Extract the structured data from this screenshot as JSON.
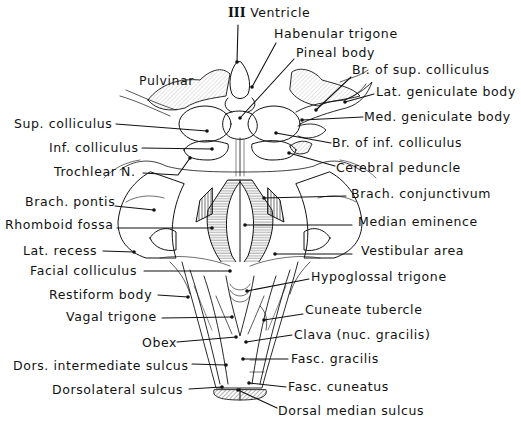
{
  "figure": {
    "ink_color": "#111111",
    "background_color": "#ffffff"
  },
  "labels": {
    "third_ventricle": {
      "roman": "III",
      "text": "Ventricle",
      "x": 228,
      "y": 6,
      "ptr": [
        [
          238,
          25
        ],
        [
          237,
          62
        ]
      ]
    },
    "habenular_trigone": {
      "text": "Habenular trigone",
      "x": 274,
      "y": 27,
      "ptr": [
        [
          276,
          43
        ],
        [
          252,
          87
        ]
      ]
    },
    "pineal_body": {
      "text": "Pineal body",
      "x": 296,
      "y": 46,
      "ptr": [
        [
          294,
          59
        ],
        [
          240,
          118
        ]
      ]
    },
    "pulvinar": {
      "text": "Pulvinar",
      "x": 139,
      "y": 74,
      "ptr": null
    },
    "br_sup_colliculus": {
      "text": "Br. of sup. colliculus",
      "x": 352,
      "y": 63,
      "ptr": [
        [
          351,
          77
        ],
        [
          316,
          110
        ]
      ]
    },
    "lat_geniculate_body": {
      "text": "Lat. geniculate body",
      "x": 376,
      "y": 85,
      "ptr": [
        [
          374,
          94
        ],
        [
          345,
          102
        ]
      ]
    },
    "med_geniculate_body": {
      "text": "Med. geniculate body",
      "x": 364,
      "y": 110,
      "ptr": [
        [
          363,
          117
        ],
        [
          302,
          120
        ]
      ]
    },
    "sup_colliculus": {
      "text": "Sup. colliculus",
      "x": 14,
      "y": 117,
      "ptr": [
        [
          116,
          124
        ],
        [
          207,
          131
        ]
      ]
    },
    "br_inf_colliculus": {
      "text": "Br. of inf. colliculus",
      "x": 332,
      "y": 136,
      "ptr": [
        [
          331,
          143
        ],
        [
          276,
          133
        ]
      ]
    },
    "inf_colliculus": {
      "text": "Inf. colliculus",
      "x": 49,
      "y": 141,
      "ptr": [
        [
          142,
          148
        ],
        [
          212,
          149
        ]
      ]
    },
    "cerebral_peduncle": {
      "text": "Cerebral peduncle",
      "x": 336,
      "y": 161,
      "ptr": [
        [
          335,
          166
        ],
        [
          289,
          153
        ]
      ]
    },
    "trochlear_n": {
      "text": "Trochlear N.",
      "x": 54,
      "y": 165,
      "ptr": [
        [
          143,
          173
        ],
        [
          178,
          175
        ],
        [
          190,
          158
        ]
      ]
    },
    "brach_conjunctivum": {
      "text": "Brach. conjunctivum",
      "x": 351,
      "y": 187,
      "ptr": [
        [
          346,
          196
        ],
        [
          264,
          198
        ]
      ]
    },
    "brach_pontis": {
      "text": "Brach. pontis",
      "x": 25,
      "y": 195,
      "ptr": [
        [
          115,
          206
        ],
        [
          154,
          210
        ]
      ]
    },
    "rhomboid_fossa": {
      "text": "Rhomboid fossa",
      "x": 5,
      "y": 218,
      "ptr": [
        [
          117,
          228
        ],
        [
          212,
          228
        ]
      ]
    },
    "median_eminence": {
      "text": "Median eminence",
      "x": 358,
      "y": 215,
      "ptr": [
        [
          352,
          225
        ],
        [
          245,
          225
        ]
      ]
    },
    "lat_recess": {
      "text": "Lat. recess",
      "x": 23,
      "y": 244,
      "ptr": [
        [
          103,
          251
        ],
        [
          134,
          252
        ]
      ]
    },
    "vestibular_area": {
      "text": "Vestibular area",
      "x": 361,
      "y": 244,
      "ptr": [
        [
          352,
          254
        ],
        [
          275,
          254
        ]
      ]
    },
    "facial_colliculus": {
      "text": "Facial colliculus",
      "x": 30,
      "y": 264,
      "ptr": [
        [
          144,
          271
        ],
        [
          230,
          271
        ]
      ]
    },
    "hypoglossal_trigone": {
      "text": "Hypoglossal trigone",
      "x": 311,
      "y": 270,
      "ptr": [
        [
          309,
          279
        ],
        [
          247,
          291
        ]
      ]
    },
    "restiform_body": {
      "text": "Restiform body",
      "x": 49,
      "y": 288,
      "ptr": [
        [
          158,
          295
        ],
        [
          188,
          297
        ]
      ]
    },
    "cuneate_tubercle": {
      "text": "Cuneate tubercle",
      "x": 305,
      "y": 303,
      "ptr": [
        [
          303,
          314
        ],
        [
          264,
          320
        ]
      ]
    },
    "vagal_trigone": {
      "text": "Vagal trigone",
      "x": 66,
      "y": 310,
      "ptr": [
        [
          162,
          318
        ],
        [
          232,
          317
        ]
      ]
    },
    "clava": {
      "text": "Clava (nuc. gracilis)",
      "x": 294,
      "y": 328,
      "ptr": [
        [
          292,
          335
        ],
        [
          246,
          342
        ]
      ]
    },
    "obex": {
      "text": "Obex",
      "x": 142,
      "y": 336,
      "ptr": [
        [
          177,
          342
        ],
        [
          236,
          337
        ]
      ]
    },
    "fasc_gracilis": {
      "text": "Fasc. gracilis",
      "x": 291,
      "y": 352,
      "ptr": [
        [
          288,
          359
        ],
        [
          243,
          359
        ]
      ]
    },
    "dors_intermediate_sulcus": {
      "text": "Dors. intermediate sulcus",
      "x": 13,
      "y": 359,
      "ptr": [
        [
          192,
          364
        ],
        [
          226,
          365
        ]
      ]
    },
    "fasc_cuneatus": {
      "text": "Fasc. cuneatus",
      "x": 288,
      "y": 380,
      "ptr": [
        [
          286,
          387
        ],
        [
          249,
          383
        ]
      ]
    },
    "dorsolateral_sulcus": {
      "text": "Dorsolateral sulcus",
      "x": 52,
      "y": 383,
      "ptr": [
        [
          189,
          389
        ],
        [
          222,
          387
        ]
      ]
    },
    "dorsal_median_sulcus": {
      "text": "Dorsal median sulcus",
      "x": 278,
      "y": 404,
      "ptr": [
        [
          277,
          408
        ],
        [
          238,
          390
        ]
      ]
    }
  }
}
